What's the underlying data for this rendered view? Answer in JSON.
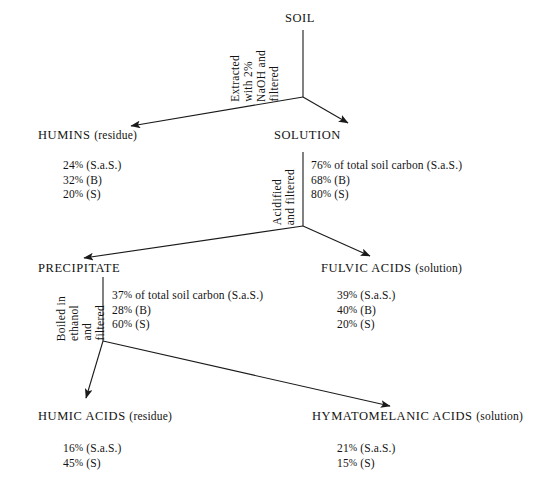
{
  "diagram": {
    "background_color": "#ffffff",
    "line_color": "#1a1a1a",
    "nodes": {
      "soil": {
        "name": "SOIL",
        "qualifier": ""
      },
      "humins": {
        "name": "HUMINS",
        "qualifier": "(residue)"
      },
      "solution": {
        "name": "SOLUTION",
        "qualifier": ""
      },
      "precipitate": {
        "name": "PRECIPITATE",
        "qualifier": ""
      },
      "fulvic_acids": {
        "name": "FULVIC  ACIDS",
        "qualifier": "(solution)"
      },
      "humic_acids": {
        "name": "HUMIC  ACIDS",
        "qualifier": "(residue)"
      },
      "hymatomelanic_acids": {
        "name": "HYMATOMELANIC  ACIDS",
        "qualifier": "(solution)"
      }
    },
    "process_labels": {
      "extraction": {
        "line1": "Extracted",
        "line2": "with 2%",
        "line3": "NaOH and",
        "line4": "filtered"
      },
      "acidification": {
        "line1": "Acidified",
        "line2": "and filtered"
      },
      "ethanol_boil": {
        "line1": "Boiled in",
        "line2": "ethanol",
        "line3": "and",
        "line4": "filtered"
      }
    },
    "stats": {
      "humins": [
        {
          "value": "24",
          "unit": "%",
          "sample": "(S.a.S.)"
        },
        {
          "value": "32",
          "unit": "%",
          "sample": "(B)"
        },
        {
          "value": "20",
          "unit": "%",
          "sample": "(S)"
        }
      ],
      "solution": [
        {
          "value": "76",
          "unit": "%",
          "sample": "of total soil carbon (S.a.S.)"
        },
        {
          "value": "68",
          "unit": "%",
          "sample": "(B)"
        },
        {
          "value": "80",
          "unit": "%",
          "sample": "(S)"
        }
      ],
      "precipitate": [
        {
          "value": "37",
          "unit": "%",
          "sample": "of total soil carbon (S.a.S.)"
        },
        {
          "value": "28",
          "unit": "%",
          "sample": "(B)"
        },
        {
          "value": "60",
          "unit": "%",
          "sample": "(S)"
        }
      ],
      "fulvic_acids": [
        {
          "value": "39",
          "unit": "%",
          "sample": "(S.a.S.)"
        },
        {
          "value": "40",
          "unit": "%",
          "sample": "(B)"
        },
        {
          "value": "20",
          "unit": "%",
          "sample": "(S)"
        }
      ],
      "humic_acids": [
        {
          "value": "16",
          "unit": "%",
          "sample": "(S.a.S.)"
        },
        {
          "value": "45",
          "unit": "%",
          "sample": "(S)"
        }
      ],
      "hymatomelanic_acids": [
        {
          "value": "21",
          "unit": "%",
          "sample": "(S.a.S.)"
        },
        {
          "value": "15",
          "unit": "%",
          "sample": "(S)"
        }
      ]
    },
    "stat_text": {
      "humins_1": "24% (S.a.S.)",
      "humins_2": "32% (B)",
      "humins_3": "20% (S)",
      "solution_1": "76% of total soil carbon (S.a.S.)",
      "solution_2": "68% (B)",
      "solution_3": "80% (S)",
      "precipitate_1": "37% of total soil carbon (S.a.S.)",
      "precipitate_2": "28% (B)",
      "precipitate_3": "60% (S)",
      "fulvic_1": "39% (S.a.S.)",
      "fulvic_2": "40% (B)",
      "fulvic_3": "20% (S)",
      "humic_1": "16% (S.a.S.)",
      "humic_2": "45% (S)",
      "hymato_1": "21% (S.a.S.)",
      "hymato_2": "15% (S)"
    }
  }
}
